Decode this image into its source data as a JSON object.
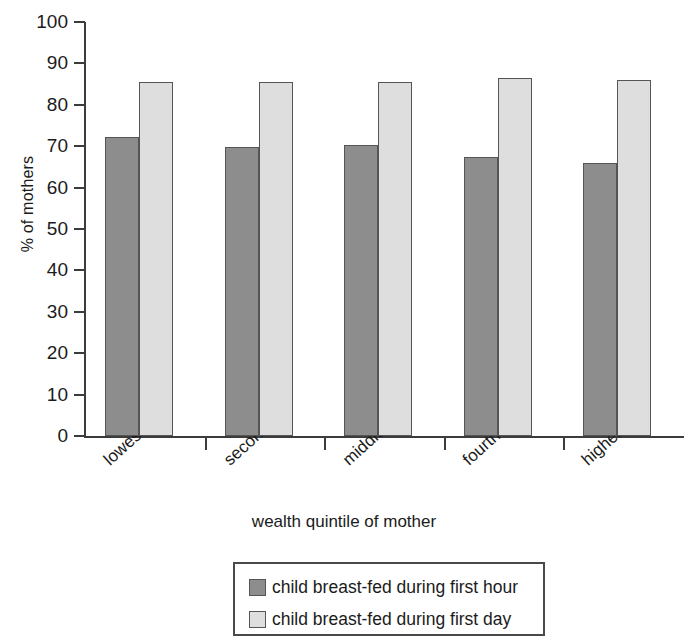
{
  "chart_data": {
    "type": "bar",
    "title": "",
    "subtitle": "",
    "xlabel": "wealth quintile of mother",
    "ylabel": "% of mothers",
    "categories": [
      "lowest",
      "second",
      "middle",
      "fourth",
      "highest"
    ],
    "series": [
      {
        "name": "child breast-fed during first hour",
        "color": "#8d8d8d",
        "values": [
          72.3,
          69.8,
          70.2,
          67.3,
          66.0
        ]
      },
      {
        "name": "child breast-fed during first day",
        "color": "#dedede",
        "values": [
          85.5,
          85.6,
          85.6,
          86.4,
          86.0
        ]
      }
    ],
    "ylim": [
      0,
      100
    ],
    "ytick_labels": [
      "100",
      "90",
      "80",
      "70",
      "60",
      "50",
      "40",
      "30",
      "20",
      "10",
      "0"
    ],
    "ytick_values": [
      100,
      90,
      80,
      70,
      60,
      50,
      40,
      30,
      20,
      10,
      0
    ],
    "grid": false,
    "legend_position": "bottom",
    "legend_entries": [
      "child breast-fed during first hour",
      "child breast-fed during first day"
    ],
    "axis_color": "#3c3c3c",
    "bar_border_color": "#555555",
    "background": "#ffffff"
  }
}
